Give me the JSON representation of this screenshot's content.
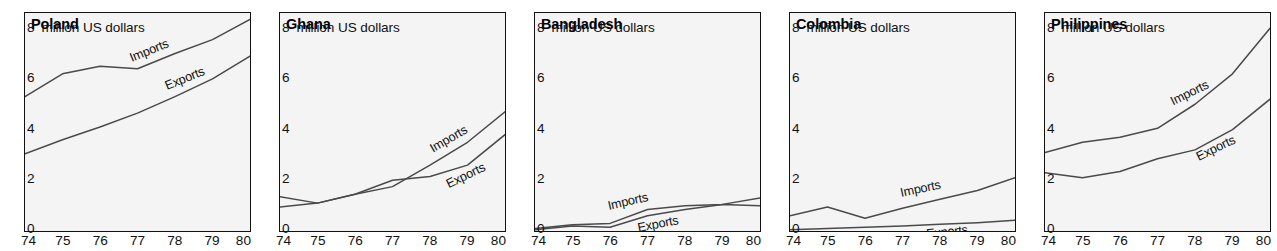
{
  "figure": {
    "unit_caption": "8 million US dollars",
    "y_ticks": [
      "8",
      "6",
      "4",
      "2",
      "0"
    ],
    "y_tick_values": [
      8,
      6,
      4,
      2,
      0
    ],
    "x_ticks": [
      "74",
      "75",
      "76",
      "77",
      "78",
      "79",
      "80"
    ],
    "series_names": {
      "imports": "Imports",
      "exports": "Exports"
    },
    "line_color": "#4a4a4a",
    "frame_color": "#111111",
    "panel_background": "#f4f4f4"
  },
  "chart_data": [
    {
      "type": "line",
      "title": "Poland",
      "xlabel": "",
      "ylabel": "million US dollars",
      "x": [
        74,
        75,
        76,
        77,
        78,
        79,
        80
      ],
      "xlim": [
        74,
        80
      ],
      "ylim": [
        0,
        8.6
      ],
      "grid": false,
      "legend": "inline-labels",
      "series": [
        {
          "name": "Imports",
          "values": [
            5.3,
            6.2,
            6.5,
            6.4,
            7.0,
            7.55,
            8.35
          ]
        },
        {
          "name": "Exports",
          "values": [
            3.05,
            3.6,
            4.1,
            4.65,
            5.3,
            6.0,
            6.9
          ]
        }
      ]
    },
    {
      "type": "line",
      "title": "Ghana",
      "xlabel": "",
      "ylabel": "million US dollars",
      "x": [
        74,
        75,
        76,
        77,
        78,
        79,
        80
      ],
      "xlim": [
        74,
        80
      ],
      "ylim": [
        0,
        8.6
      ],
      "grid": false,
      "legend": "inline-labels",
      "series": [
        {
          "name": "Imports",
          "values": [
            1.35,
            1.1,
            1.45,
            1.75,
            2.6,
            3.5,
            4.7
          ]
        },
        {
          "name": "Exports",
          "values": [
            0.95,
            1.1,
            1.45,
            2.0,
            2.15,
            2.6,
            3.8
          ]
        }
      ]
    },
    {
      "type": "line",
      "title": "Bangladesh",
      "xlabel": "",
      "ylabel": "million US dollars",
      "x": [
        74,
        75,
        76,
        77,
        78,
        79,
        80
      ],
      "xlim": [
        74,
        80
      ],
      "ylim": [
        0,
        8.6
      ],
      "grid": false,
      "legend": "inline-labels",
      "series": [
        {
          "name": "Imports",
          "values": [
            0.1,
            0.25,
            0.3,
            0.85,
            1.0,
            1.05,
            1.3
          ]
        },
        {
          "name": "Exports",
          "values": [
            0.05,
            0.2,
            0.15,
            0.6,
            0.85,
            1.05,
            1.0
          ]
        }
      ]
    },
    {
      "type": "line",
      "title": "Colombia",
      "xlabel": "",
      "ylabel": "million US dollars",
      "x": [
        74,
        75,
        76,
        77,
        78,
        79,
        80
      ],
      "xlim": [
        74,
        80
      ],
      "ylim": [
        0,
        8.6
      ],
      "grid": false,
      "legend": "inline-labels",
      "series": [
        {
          "name": "Imports",
          "values": [
            0.6,
            0.95,
            0.5,
            0.9,
            1.25,
            1.6,
            2.1
          ]
        },
        {
          "name": "Exports",
          "values": [
            0.05,
            0.1,
            0.15,
            0.2,
            0.27,
            0.33,
            0.42
          ]
        }
      ]
    },
    {
      "type": "line",
      "title": "Philippines",
      "xlabel": "",
      "ylabel": "million US dollars",
      "x": [
        74,
        75,
        76,
        77,
        78,
        79,
        80
      ],
      "xlim": [
        74,
        80
      ],
      "ylim": [
        0,
        8.6
      ],
      "grid": false,
      "legend": "inline-labels",
      "series": [
        {
          "name": "Imports",
          "values": [
            3.1,
            3.5,
            3.7,
            4.05,
            5.0,
            6.2,
            8.0
          ]
        },
        {
          "name": "Exports",
          "values": [
            2.3,
            2.1,
            2.35,
            2.85,
            3.2,
            4.0,
            5.2
          ]
        }
      ]
    }
  ],
  "label_placement": [
    {
      "imports": {
        "x": 77.35,
        "dy": -9,
        "angle": -22
      },
      "exports": {
        "x": 78.3,
        "dy": -9,
        "angle": -22
      }
    },
    {
      "imports": {
        "x": 78.55,
        "dy": -10,
        "angle": -30
      },
      "exports": {
        "x": 79.0,
        "dy": 14,
        "angle": -26
      }
    },
    {
      "imports": {
        "x": 76.5,
        "dy": -11,
        "angle": -13
      },
      "exports": {
        "x": 77.3,
        "dy": 14,
        "angle": -11
      }
    },
    {
      "imports": {
        "x": 77.5,
        "dy": -11,
        "angle": -12
      },
      "exports": {
        "x": 78.2,
        "dy": 12,
        "angle": -6
      }
    },
    {
      "imports": {
        "x": 77.9,
        "dy": -10,
        "angle": -26
      },
      "exports": {
        "x": 78.6,
        "dy": 14,
        "angle": -26
      }
    }
  ]
}
